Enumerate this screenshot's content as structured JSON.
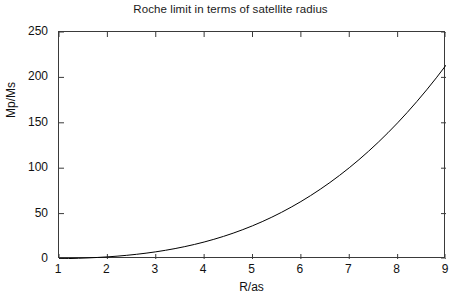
{
  "chart_data": {
    "type": "line",
    "title": "Roche limit in terms of satellite radius",
    "xlabel": "R/as",
    "ylabel": "Mp/Ms",
    "xlim": [
      1,
      9
    ],
    "ylim": [
      0,
      250
    ],
    "xticks": [
      "1",
      "2",
      "3",
      "4",
      "5",
      "6",
      "7",
      "8",
      "9"
    ],
    "yticks": [
      "0",
      "50",
      "100",
      "150",
      "200",
      "250"
    ],
    "grid": false,
    "legend": false,
    "line_color": "#000000",
    "series": [
      {
        "name": "Roche limit",
        "x": [
          1.0,
          1.2,
          1.4,
          1.6,
          1.8,
          2.0,
          2.2,
          2.4,
          2.6,
          2.8,
          3.0,
          3.2,
          3.4,
          3.6,
          3.8,
          4.0,
          4.2,
          4.4,
          4.6,
          4.8,
          5.0,
          5.2,
          5.4,
          5.6,
          5.8,
          6.0,
          6.2,
          6.4,
          6.6,
          6.8,
          7.0,
          7.2,
          7.4,
          7.6,
          7.8,
          8.0,
          8.2,
          8.4,
          8.6,
          8.8,
          9.0
        ],
        "y": [
          0.29,
          0.5,
          0.8,
          1.2,
          1.71,
          2.34,
          3.12,
          4.05,
          5.15,
          6.43,
          7.9,
          9.58,
          11.49,
          13.64,
          16.03,
          18.7,
          21.65,
          24.89,
          28.45,
          32.34,
          36.56,
          41.13,
          46.08,
          51.4,
          57.12,
          63.25,
          69.8,
          76.78,
          84.21,
          92.11,
          100.48,
          109.34,
          118.71,
          128.59,
          139.01,
          149.97,
          161.49,
          173.58,
          186.26,
          199.54,
          213.44
        ]
      }
    ]
  },
  "axes": {
    "title": "Roche limit in terms of satellite radius",
    "x_label": "R/as",
    "y_label": "Mp/Ms"
  }
}
